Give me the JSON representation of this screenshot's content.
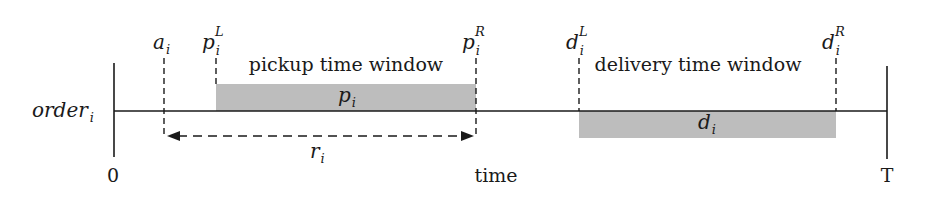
{
  "diagram": {
    "type": "timeline",
    "row_label": {
      "base": "order",
      "sub": "i"
    },
    "axis": {
      "start_label": "0",
      "end_label": "T",
      "axis_label": "time"
    },
    "markers": [
      {
        "id": "a",
        "base": "a",
        "sub": "i",
        "sup": ""
      },
      {
        "id": "pL",
        "base": "p",
        "sub": "i",
        "sup": "L"
      },
      {
        "id": "pR",
        "base": "p",
        "sub": "i",
        "sup": "R"
      },
      {
        "id": "dL",
        "base": "d",
        "sub": "i",
        "sup": "L"
      },
      {
        "id": "dR",
        "base": "d",
        "sub": "i",
        "sup": "R"
      }
    ],
    "windows": [
      {
        "id": "pickup",
        "title": "pickup time window",
        "bar_label": {
          "base": "p",
          "sub": "i"
        },
        "position": "above"
      },
      {
        "id": "delivery",
        "title": "delivery time window",
        "bar_label": {
          "base": "d",
          "sub": "i"
        },
        "position": "below"
      }
    ],
    "interval": {
      "base": "r",
      "sub": "i",
      "from": "a",
      "to": "pR",
      "arrows": "both"
    },
    "colors": {
      "bar_fill": "#bdbdbd",
      "line": "#1a1a1a",
      "background": "#ffffff"
    }
  }
}
